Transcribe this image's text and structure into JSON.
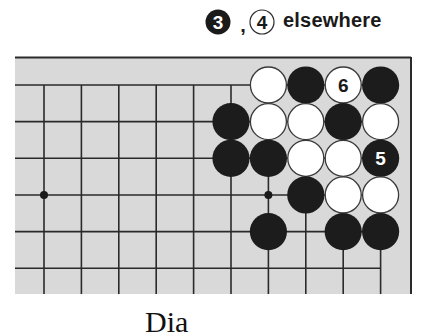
{
  "heading": {
    "move_a": {
      "number": "3",
      "color": "black"
    },
    "separator": ",",
    "move_b": {
      "number": "4",
      "color": "white"
    },
    "text": "elsewhere"
  },
  "board": {
    "background": "#d9d9d9",
    "line_color": "#2a2a2a",
    "columns": 10,
    "rows": 6,
    "edges": {
      "top": true,
      "right": true,
      "left": false,
      "bottom": false
    },
    "hoshi": [
      {
        "col": 0,
        "row": 3
      },
      {
        "col": 6,
        "row": 3
      }
    ],
    "stones": [
      {
        "col": 6,
        "row": 0,
        "color": "white",
        "label": ""
      },
      {
        "col": 7,
        "row": 0,
        "color": "black",
        "label": ""
      },
      {
        "col": 8,
        "row": 0,
        "color": "white",
        "label": "6"
      },
      {
        "col": 9,
        "row": 0,
        "color": "black",
        "label": ""
      },
      {
        "col": 5,
        "row": 1,
        "color": "black",
        "label": ""
      },
      {
        "col": 6,
        "row": 1,
        "color": "white",
        "label": ""
      },
      {
        "col": 7,
        "row": 1,
        "color": "white",
        "label": ""
      },
      {
        "col": 8,
        "row": 1,
        "color": "black",
        "label": ""
      },
      {
        "col": 9,
        "row": 1,
        "color": "white",
        "label": ""
      },
      {
        "col": 5,
        "row": 2,
        "color": "black",
        "label": ""
      },
      {
        "col": 6,
        "row": 2,
        "color": "black",
        "label": ""
      },
      {
        "col": 7,
        "row": 2,
        "color": "white",
        "label": ""
      },
      {
        "col": 8,
        "row": 2,
        "color": "white",
        "label": ""
      },
      {
        "col": 9,
        "row": 2,
        "color": "black",
        "label": "5"
      },
      {
        "col": 7,
        "row": 3,
        "color": "black",
        "label": ""
      },
      {
        "col": 8,
        "row": 3,
        "color": "white",
        "label": ""
      },
      {
        "col": 9,
        "row": 3,
        "color": "white",
        "label": ""
      },
      {
        "col": 6,
        "row": 4,
        "color": "black",
        "label": ""
      },
      {
        "col": 8,
        "row": 4,
        "color": "black",
        "label": ""
      },
      {
        "col": 9,
        "row": 4,
        "color": "black",
        "label": ""
      }
    ]
  },
  "caption": "Dia"
}
